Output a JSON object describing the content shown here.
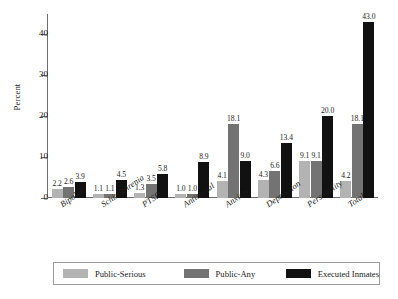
{
  "chart_data": {
    "type": "bar",
    "title": "",
    "subtitle": "",
    "xlabel": "",
    "ylabel": "Percent",
    "ylim": [
      0,
      45
    ],
    "yticks": [
      0,
      10,
      20,
      30,
      40
    ],
    "ytick_labels": [
      "0",
      "10",
      "20",
      "30",
      "40"
    ],
    "grid": false,
    "legend_position": "bottom",
    "categories": [
      "Bipolar",
      "Schizophrenia",
      "PTSD",
      "Antisocial",
      "Anxiety",
      "Depression",
      "Personality",
      "Total"
    ],
    "series": [
      {
        "name": "Public-Serious",
        "color": "#b3b3b3",
        "values": [
          2.2,
          1.1,
          1.3,
          1.0,
          4.1,
          4.3,
          9.1,
          4.2
        ],
        "labels": [
          "2.2",
          "1.1",
          "1.3",
          "1.0",
          "4.1",
          "4.3",
          "9.1",
          "4.2"
        ]
      },
      {
        "name": "Public-Any",
        "color": "#737373",
        "values": [
          2.6,
          1.1,
          3.5,
          1.0,
          18.1,
          6.6,
          9.1,
          18.1
        ],
        "labels": [
          "2.6",
          "1.1",
          "3.5",
          "1.0",
          "18.1",
          "6.6",
          "9.1",
          "18.1"
        ]
      },
      {
        "name": "Executed Inmates",
        "color": "#111111",
        "values": [
          3.9,
          4.5,
          5.8,
          8.9,
          9.0,
          13.4,
          20.0,
          43.0
        ],
        "labels": [
          "3.9",
          "4.5",
          "5.8",
          "8.9",
          "9.0",
          "13.4",
          "20.0",
          "43.0"
        ]
      }
    ]
  },
  "axis": {
    "y_title": "Percent"
  },
  "legend": {
    "entries": [
      {
        "label": "Public-Serious",
        "color": "#b3b3b3"
      },
      {
        "label": "Public-Any",
        "color": "#737373"
      },
      {
        "label": "Executed Inmates",
        "color": "#111111"
      }
    ]
  }
}
